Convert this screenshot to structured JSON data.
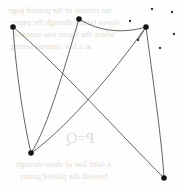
{
  "figure": {
    "name": "scanned-graph-figure",
    "width": 183,
    "height": 193,
    "background_color": "#fefefe",
    "ink_color": "#17151 4",
    "edge_color": "#55524f",
    "bleed_text_color": "#d9d6d2"
  },
  "chart_data": {
    "type": "scatter",
    "title": "",
    "subtitle": "",
    "xlabel": "",
    "ylabel": "",
    "xlim": [
      0,
      183
    ],
    "ylim": [
      0,
      193
    ],
    "grid": false,
    "legend": "none",
    "axes_visible": false,
    "series": [
      {
        "name": "vertices",
        "marker": "filled-circle",
        "marker_size": 5.6,
        "color": "#171514",
        "points": [
          {
            "id": "v1",
            "label": "top-left",
            "x": 13,
            "y": 27
          },
          {
            "id": "v2",
            "label": "top-center",
            "x": 79,
            "y": 19
          },
          {
            "id": "v3",
            "label": "top-right",
            "x": 146,
            "y": 27
          },
          {
            "id": "v4",
            "label": "bottom-left",
            "x": 31,
            "y": 153
          },
          {
            "id": "v5",
            "label": "bottom-right",
            "x": 164,
            "y": 178
          }
        ]
      },
      {
        "name": "stray-dots",
        "marker": "filled-circle",
        "marker_size": 2.3,
        "color": "#2b2826",
        "points": [
          {
            "id": "d1",
            "x": 152,
            "y": 9
          },
          {
            "id": "d2",
            "x": 172,
            "y": 12
          },
          {
            "id": "d3",
            "x": 130,
            "y": 21
          },
          {
            "id": "d4",
            "x": 174,
            "y": 34
          },
          {
            "id": "d5",
            "x": 138,
            "y": 40
          },
          {
            "id": "d6",
            "x": 160,
            "y": 48
          }
        ]
      }
    ],
    "edges": [
      {
        "id": "e1",
        "from": "v1",
        "to": "v4",
        "path": "M 13 27 C 15 60, 22 115, 31 153",
        "note": "left side, gently bowed"
      },
      {
        "id": "e2",
        "from": "v1",
        "to": "v5",
        "path": "M 13 27 C 55 62, 120 134, 164 178",
        "note": "long diagonal to lower right"
      },
      {
        "id": "e3",
        "from": "v2",
        "to": "v4",
        "path": "M 79 19 C 66 62, 48 128, 31 153",
        "note": "upper centre down to lower left"
      },
      {
        "id": "e4",
        "from": "v4",
        "to": "v5",
        "path": "M 31 153 C 52 139, 95 98, 146 27",
        "note": "lower left rising to upper right"
      },
      {
        "id": "e5",
        "from": "v2",
        "to": "v3",
        "path": "M 79 19 C 101 33, 126 33, 146 27",
        "note": "shallow arc across the top"
      },
      {
        "id": "e6",
        "from": "v3",
        "to": "v5",
        "path": "M 146 27 C 152 74, 162 140, 164 178",
        "note": "right side descending"
      },
      {
        "id": "e7",
        "from": "v3",
        "to": "d5",
        "path": "M 146 27 L 138 40",
        "note": "short stub to small dot"
      }
    ]
  },
  "bleed_text": {
    "note": "Faint show-through from the reverse of the scanned page; rendered mirrored and nearly illegible.",
    "lines": [
      {
        "text": "the reverse of the printed page",
        "x": 8,
        "y": 6,
        "size": 8
      },
      {
        "text": "shows faintly through the paper",
        "x": 12,
        "y": 18,
        "size": 8
      },
      {
        "text": "where the figure was scanned",
        "x": 14,
        "y": 30,
        "size": 8
      },
      {
        "text": "at a low contrast setting",
        "x": 10,
        "y": 42,
        "size": 8
      },
      {
        "text": "P=Q",
        "x": 66,
        "y": 130,
        "size": 15
      },
      {
        "text": "a faint line of show-through",
        "x": 16,
        "y": 160,
        "size": 8
      },
      {
        "text": "beneath the plotted points",
        "x": 20,
        "y": 172,
        "size": 8
      }
    ]
  }
}
